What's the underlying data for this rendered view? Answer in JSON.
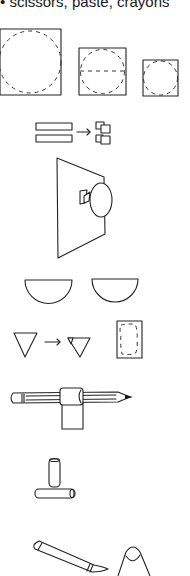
{
  "caption": {
    "bullet": "•",
    "text": "scissors, paste, crayons"
  },
  "steps": [
    {
      "id": "squares-with-dashed-circles",
      "description": "Three squares of decreasing size, each with a dashed circle inscribed; middle square has a dashed horizontal line"
    },
    {
      "id": "strips-to-pieces",
      "description": "Two paper strips, arrow, cut into small square pieces",
      "arrow": "→"
    },
    {
      "id": "trapezoid-with-face",
      "description": "Trapezoid shape with an oval and small folded square attached"
    },
    {
      "id": "half-circles",
      "description": "Two half-circle shapes"
    },
    {
      "id": "triangle-fold",
      "description": "Triangle, arrow, triangle with folded corner; rectangle with dashed outline",
      "arrow": "→"
    },
    {
      "id": "pencil-roll",
      "description": "Pencil with paper rolled around it forming a tube with a tab"
    },
    {
      "id": "tubes",
      "description": "Small vertical tube standing on a horizontal tube"
    },
    {
      "id": "crayon-and-cone",
      "description": "Crayon and cone/finger shape"
    }
  ],
  "colors": {
    "ink": "#222222",
    "paper": "#ffffff"
  }
}
